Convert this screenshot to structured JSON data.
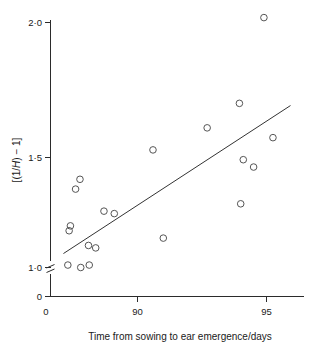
{
  "chart_data": {
    "type": "scatter",
    "title": "",
    "xlabel": "Time from sowing to ear emergence/days",
    "ylabel": "[(1/H) − 1]",
    "ylabel_parts": {
      "prefix": "[(1/",
      "italic": "H",
      "suffix": ") − 1]"
    },
    "xlim": [
      87.0,
      96.3
    ],
    "ylim": [
      0.93,
      2.05
    ],
    "grid": false,
    "legend": null,
    "xticks": [
      {
        "label": "0",
        "value": 87.0,
        "is_origin": true
      },
      {
        "label": "90",
        "value": 90
      },
      {
        "label": "95",
        "value": 95
      }
    ],
    "yticks": [
      {
        "label": "0",
        "value": 0.955,
        "is_origin": true
      },
      {
        "label": "1·0",
        "value": 1.0
      },
      {
        "label": "1·5",
        "value": 1.5
      },
      {
        "label": "2·0",
        "value": 2.0
      }
    ],
    "y_axis_break": true,
    "y_axis_break_value": 0.975,
    "points": [
      {
        "x": 87.3,
        "y": 1.01
      },
      {
        "x": 87.35,
        "y": 1.15
      },
      {
        "x": 87.4,
        "y": 1.17
      },
      {
        "x": 87.6,
        "y": 1.32
      },
      {
        "x": 87.77,
        "y": 1.36
      },
      {
        "x": 87.8,
        "y": 1.0
      },
      {
        "x": 88.1,
        "y": 1.09
      },
      {
        "x": 88.13,
        "y": 1.01
      },
      {
        "x": 88.38,
        "y": 1.08
      },
      {
        "x": 88.7,
        "y": 1.23
      },
      {
        "x": 89.1,
        "y": 1.22
      },
      {
        "x": 90.6,
        "y": 1.48
      },
      {
        "x": 91.0,
        "y": 1.12
      },
      {
        "x": 92.7,
        "y": 1.57
      },
      {
        "x": 93.95,
        "y": 1.67
      },
      {
        "x": 94.0,
        "y": 1.26
      },
      {
        "x": 94.1,
        "y": 1.44
      },
      {
        "x": 94.5,
        "y": 1.41
      },
      {
        "x": 94.9,
        "y": 2.02
      },
      {
        "x": 95.25,
        "y": 1.53
      }
    ],
    "fit_line": {
      "type": "linear-regression",
      "x_start": 87.13,
      "y_start": 1.057,
      "x_end": 95.93,
      "y_end": 1.661
    },
    "colors": {
      "axis": "#2b2b2b",
      "marker": "#555555",
      "line": "#333333",
      "background": "#ffffff",
      "text": "#1a1a1a"
    }
  }
}
